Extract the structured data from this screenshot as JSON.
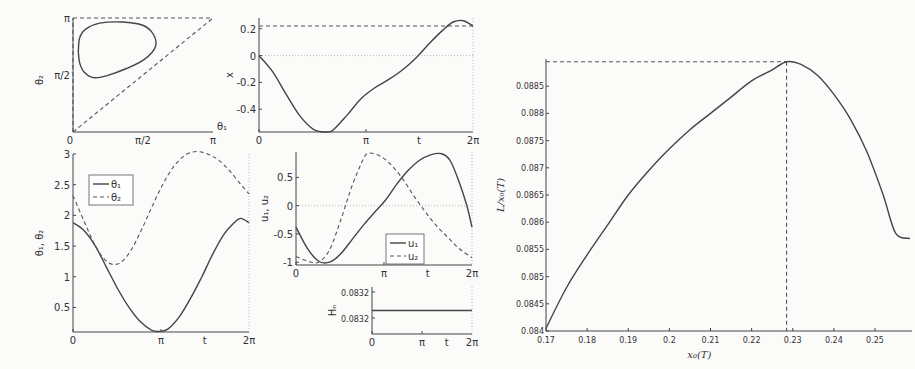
{
  "chart_data": [
    {
      "id": "phase",
      "type": "line",
      "title": "",
      "xlabel": "θ₁",
      "ylabel": "θ₂",
      "xlim": [
        0,
        3.1416
      ],
      "ylim": [
        0,
        3.1416
      ],
      "xticks": [
        "0",
        "π/2",
        "π"
      ],
      "yticks": [
        "π/2",
        "π"
      ],
      "series": [
        {
          "name": "closed orbit (θ₁,θ₂)",
          "style": "solid",
          "points": [
            [
              0.12,
              2.2
            ],
            [
              0.15,
              2.6
            ],
            [
              0.3,
              2.85
            ],
            [
              0.6,
              3.0
            ],
            [
              1.1,
              3.03
            ],
            [
              1.55,
              2.95
            ],
            [
              1.8,
              2.7
            ],
            [
              1.85,
              2.35
            ],
            [
              1.6,
              2.0
            ],
            [
              1.2,
              1.75
            ],
            [
              0.75,
              1.55
            ],
            [
              0.45,
              1.5
            ],
            [
              0.25,
              1.65
            ],
            [
              0.15,
              1.9
            ],
            [
              0.12,
              2.2
            ]
          ]
        },
        {
          "name": "θ₂=θ₁ diagonal",
          "style": "dash",
          "points": [
            [
              0,
              0
            ],
            [
              3.1416,
              3.1416
            ]
          ]
        },
        {
          "name": "θ₂=π boundary",
          "style": "dash",
          "points": [
            [
              0,
              3.1416
            ],
            [
              3.1416,
              3.1416
            ]
          ]
        },
        {
          "name": "θ₁=0 boundary",
          "style": "dash",
          "points": [
            [
              0,
              0
            ],
            [
              0,
              3.1416
            ]
          ]
        }
      ]
    },
    {
      "id": "x_t",
      "type": "line",
      "xlabel": "t",
      "ylabel": "x",
      "xlim": [
        0,
        6.2832
      ],
      "ylim": [
        -0.57,
        0.28
      ],
      "xticks": [
        "0",
        "π",
        "2π"
      ],
      "yticks": [
        "0.2",
        "0",
        "-0.2",
        "-0.4"
      ],
      "series": [
        {
          "name": "x(t)",
          "style": "solid",
          "x": [
            0,
            0.4,
            0.8,
            1.2,
            1.6,
            2.0,
            2.2,
            2.6,
            3.0,
            3.4,
            3.8,
            4.2,
            4.6,
            5.0,
            5.4,
            5.7,
            6.0,
            6.2832
          ],
          "values": [
            0,
            -0.12,
            -0.29,
            -0.45,
            -0.55,
            -0.57,
            -0.55,
            -0.44,
            -0.32,
            -0.24,
            -0.18,
            -0.11,
            -0.02,
            0.09,
            0.19,
            0.25,
            0.26,
            0.22
          ]
        },
        {
          "name": "x=0.22 reference",
          "style": "dash",
          "x": [
            0,
            6.2832
          ],
          "values": [
            0.22,
            0.22
          ]
        }
      ]
    },
    {
      "id": "theta_t",
      "type": "line",
      "xlabel": "t",
      "ylabel": "θ₁, θ₂",
      "xlim": [
        0,
        6.2832
      ],
      "ylim": [
        0.1,
        3.0
      ],
      "xticks": [
        "0",
        "π",
        "t",
        "2π"
      ],
      "yticks": [
        "0.5",
        "1",
        "1.5",
        "2",
        "2.5",
        "3"
      ],
      "legend": [
        "θ₁",
        "θ₂"
      ],
      "legend_position": "upper left",
      "series": [
        {
          "name": "θ₁",
          "style": "solid",
          "x": [
            0,
            0.4,
            0.8,
            1.2,
            1.6,
            2.0,
            2.4,
            2.8,
            3.1,
            3.4,
            3.8,
            4.2,
            4.6,
            5.0,
            5.4,
            5.8,
            6.0,
            6.2832
          ],
          "values": [
            1.88,
            1.75,
            1.5,
            1.15,
            0.8,
            0.5,
            0.27,
            0.13,
            0.11,
            0.15,
            0.35,
            0.65,
            1.0,
            1.38,
            1.7,
            1.9,
            1.95,
            1.88
          ]
        },
        {
          "name": "θ₂",
          "style": "dash",
          "x": [
            0,
            0.4,
            0.8,
            1.2,
            1.6,
            2.0,
            2.4,
            2.8,
            3.2,
            3.6,
            4.0,
            4.4,
            4.8,
            5.2,
            5.6,
            6.0,
            6.2832
          ],
          "values": [
            2.32,
            1.9,
            1.5,
            1.25,
            1.21,
            1.38,
            1.72,
            2.12,
            2.5,
            2.8,
            2.98,
            3.04,
            3.0,
            2.9,
            2.72,
            2.5,
            2.35
          ]
        }
      ]
    },
    {
      "id": "u_t",
      "type": "line",
      "xlabel": "t",
      "ylabel": "u₁, u₂",
      "xlim": [
        0,
        6.2832
      ],
      "ylim": [
        -1.05,
        0.95
      ],
      "xticks": [
        "0",
        "π",
        "t",
        "2π"
      ],
      "yticks": [
        "0.5",
        "0",
        "-0.5",
        "-1"
      ],
      "legend": [
        "u₁",
        "u₂"
      ],
      "legend_position": "lower right",
      "series": [
        {
          "name": "u₁",
          "style": "solid",
          "x": [
            0,
            0.4,
            0.8,
            1.2,
            1.6,
            2.0,
            2.4,
            2.8,
            3.2,
            3.6,
            4.0,
            4.4,
            4.8,
            5.2,
            5.5,
            5.8,
            6.1,
            6.2832
          ],
          "values": [
            -0.38,
            -0.75,
            -0.98,
            -1.0,
            -0.85,
            -0.6,
            -0.35,
            -0.12,
            0.1,
            0.38,
            0.62,
            0.8,
            0.9,
            0.92,
            0.8,
            0.45,
            0.0,
            -0.38
          ]
        },
        {
          "name": "u₂",
          "style": "dash",
          "x": [
            0,
            0.4,
            0.8,
            1.2,
            1.6,
            2.0,
            2.4,
            2.6,
            3.0,
            3.4,
            3.8,
            4.2,
            4.6,
            5.0,
            5.4,
            5.8,
            6.2832
          ],
          "values": [
            -0.9,
            -0.98,
            -1.0,
            -0.78,
            -0.25,
            0.35,
            0.82,
            0.93,
            0.88,
            0.72,
            0.48,
            0.18,
            -0.1,
            -0.35,
            -0.55,
            -0.75,
            -0.92
          ]
        }
      ]
    },
    {
      "id": "hn_t",
      "type": "line",
      "xlabel": "t",
      "ylabel": "Hₙ",
      "xlim": [
        0,
        6.2832
      ],
      "ylim": [
        0.0832,
        0.0832
      ],
      "xticks": [
        "0",
        "π",
        "t",
        "2π"
      ],
      "yticks": [
        "0.0832",
        "0.0832"
      ],
      "series": [
        {
          "name": "Hₙ",
          "style": "solid",
          "x": [
            0,
            6.2832
          ],
          "values": [
            0.0832,
            0.0832
          ]
        }
      ]
    },
    {
      "id": "L_over_x0",
      "type": "line",
      "xlabel": "x₀(T)",
      "ylabel": "L/x₀(T)",
      "xlim": [
        0.17,
        0.259
      ],
      "ylim": [
        0.084,
        0.089
      ],
      "xticks": [
        "0.17",
        "0.18",
        "0.19",
        "0.2",
        "0.21",
        "0.22",
        "0.23",
        "0.24",
        "0.25"
      ],
      "yticks": [
        "0.084",
        "0.0845",
        "0.085",
        "0.0855",
        "0.086",
        "0.0865",
        "0.087",
        "0.0875",
        "0.088",
        "0.0885"
      ],
      "grid": false,
      "annotations": [
        {
          "type": "max marker",
          "x": 0.2285,
          "y": 0.08895,
          "style": "dotted drop lines to axes"
        }
      ],
      "series": [
        {
          "name": "L/x₀(T)",
          "style": "solid",
          "x": [
            0.17,
            0.175,
            0.18,
            0.185,
            0.19,
            0.195,
            0.2,
            0.205,
            0.21,
            0.215,
            0.22,
            0.225,
            0.2285,
            0.232,
            0.236,
            0.24,
            0.244,
            0.248,
            0.252,
            0.255,
            0.2585
          ],
          "values": [
            0.08405,
            0.0848,
            0.0854,
            0.08595,
            0.0865,
            0.08695,
            0.08735,
            0.0877,
            0.088,
            0.0883,
            0.0886,
            0.0888,
            0.08895,
            0.0889,
            0.0887,
            0.08835,
            0.0879,
            0.0873,
            0.0865,
            0.0858,
            0.0857
          ]
        }
      ]
    }
  ]
}
